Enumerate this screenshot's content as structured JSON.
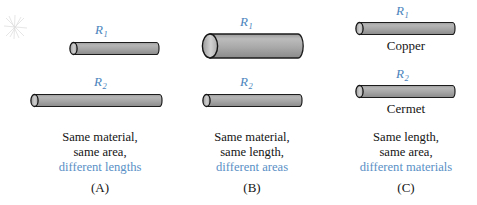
{
  "figure": {
    "type": "physics-diagram",
    "artifact": "scan-smudge-icon",
    "colors": {
      "label_blue": "#4b84bd",
      "caption_blue": "#5a90c6",
      "text_black": "#151515",
      "cylinder_body_light": "#b2b2b2",
      "cylinder_body_dark": "#8e8e8e",
      "cylinder_cap": "#c2c2c2",
      "cylinder_outline": "#1c1c1c",
      "background": "#ffffff"
    }
  },
  "panels": [
    {
      "letter": "(A)",
      "cylinders": [
        {
          "label": "R",
          "subscript": "1",
          "material": "",
          "length_px": 90,
          "diameter_px": 13
        },
        {
          "label": "R",
          "subscript": "2",
          "material": "",
          "length_px": 132,
          "diameter_px": 13
        }
      ],
      "caption": {
        "line1": "Same material,",
        "line2": "same area,",
        "line3": "different lengths"
      }
    },
    {
      "letter": "(B)",
      "cylinders": [
        {
          "label": "R",
          "subscript": "1",
          "material": "",
          "length_px": 98,
          "diameter_px": 26
        },
        {
          "label": "R",
          "subscript": "2",
          "material": "",
          "length_px": 98,
          "diameter_px": 13
        }
      ],
      "caption": {
        "line1": "Same material,",
        "line2": "same length,",
        "line3": "different areas"
      }
    },
    {
      "letter": "(C)",
      "cylinders": [
        {
          "label": "R",
          "subscript": "1",
          "material": "Copper",
          "length_px": 98,
          "diameter_px": 13
        },
        {
          "label": "R",
          "subscript": "2",
          "material": "Cermet",
          "length_px": 98,
          "diameter_px": 13
        }
      ],
      "caption": {
        "line1": "Same length,",
        "line2": "same area,",
        "line3": "different materials"
      }
    }
  ]
}
